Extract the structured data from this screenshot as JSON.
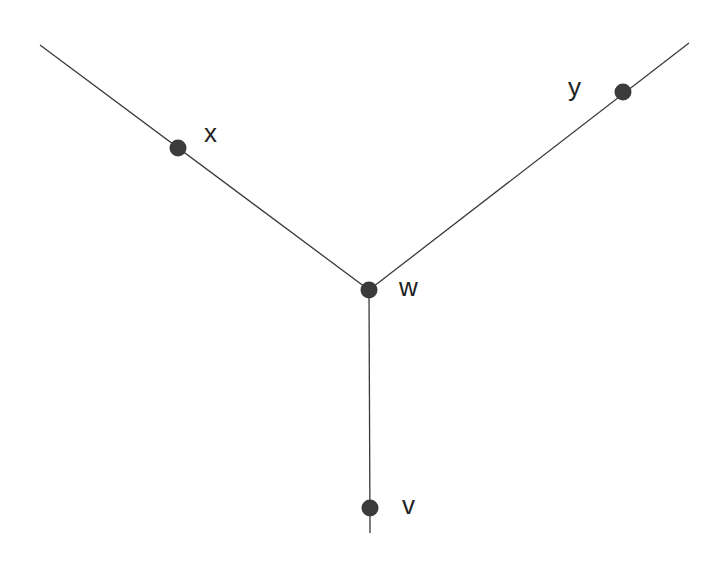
{
  "diagram": {
    "type": "tree-graph",
    "colors": {
      "edge": "#3a3a3a",
      "node": "#3b3b3b",
      "label": "#222222",
      "background": "#ffffff"
    },
    "nodes": [
      {
        "id": "x",
        "label": "x",
        "cx": 178,
        "cy": 148,
        "lx": 204,
        "ly": 142
      },
      {
        "id": "y",
        "label": "y",
        "cx": 623,
        "cy": 92,
        "lx": 568,
        "ly": 96
      },
      {
        "id": "w",
        "label": "w",
        "cx": 369,
        "cy": 290,
        "lx": 399,
        "ly": 296
      },
      {
        "id": "v",
        "label": "v",
        "cx": 370,
        "cy": 508,
        "lx": 402,
        "ly": 514
      }
    ],
    "edges": [
      {
        "from": "left-end",
        "to": "w",
        "x1": 40,
        "y1": 45,
        "x2": 369,
        "y2": 290
      },
      {
        "from": "w",
        "to": "right-end",
        "x1": 369,
        "y1": 290,
        "x2": 689,
        "y2": 43
      },
      {
        "from": "w",
        "to": "bottom-end",
        "x1": 369,
        "y1": 290,
        "x2": 370,
        "y2": 533
      }
    ]
  }
}
